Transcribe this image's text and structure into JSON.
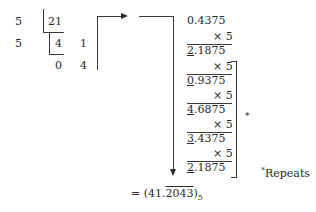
{
  "integer_part": {
    "rows": [
      {
        "divisor": "5",
        "dividend": "21"
      },
      {
        "divisor": "5",
        "quotient": "4",
        "remainder": "1"
      },
      {
        "quotient": "0",
        "remainder": "4"
      }
    ]
  },
  "fraction_part": {
    "start": "0.4375",
    "multiplier": "× 5",
    "steps": [
      {
        "int_digit": "2",
        "rest": ".1875"
      },
      {
        "int_digit": "0",
        "rest": ".9375"
      },
      {
        "int_digit": "4",
        "rest": ".6875"
      },
      {
        "int_digit": "3",
        "rest": ".4375"
      },
      {
        "int_digit": "2",
        "rest": ".1875"
      }
    ]
  },
  "bracket_marker": "*",
  "footnote": {
    "marker": "*",
    "text": "Repeats"
  },
  "result": {
    "prefix": "= (41.",
    "repeating": "2043",
    "suffix": ")",
    "base": "5"
  }
}
